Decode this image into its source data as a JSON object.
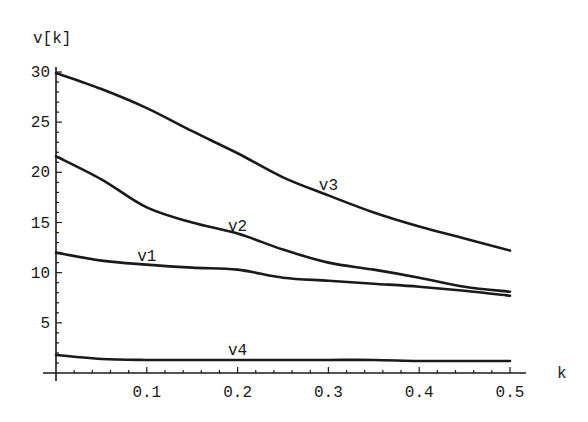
{
  "chart_data": {
    "type": "line",
    "title": "",
    "xlabel": "k",
    "ylabel": "v[k]",
    "xlim": [
      0,
      0.5
    ],
    "ylim": [
      0,
      30
    ],
    "grid": false,
    "legend": "inline curve labels",
    "x_ticks": [
      "0.1",
      "0.2",
      "0.3",
      "0.4",
      "0.5"
    ],
    "y_ticks": [
      "5",
      "10",
      "15",
      "20",
      "25",
      "30"
    ],
    "x": [
      0,
      0.05,
      0.1,
      0.15,
      0.2,
      0.25,
      0.3,
      0.35,
      0.4,
      0.45,
      0.5
    ],
    "series": [
      {
        "name": "v1",
        "values": [
          12.0,
          11.2,
          10.8,
          10.5,
          10.3,
          9.5,
          9.2,
          8.9,
          8.6,
          8.2,
          7.7
        ]
      },
      {
        "name": "v2",
        "values": [
          21.6,
          19.3,
          16.5,
          15.0,
          13.9,
          12.3,
          11.0,
          10.3,
          9.5,
          8.6,
          8.1
        ]
      },
      {
        "name": "v3",
        "values": [
          29.9,
          28.3,
          26.4,
          24.1,
          21.9,
          19.5,
          17.7,
          16.0,
          14.6,
          13.4,
          12.2
        ]
      },
      {
        "name": "v4",
        "values": [
          1.8,
          1.4,
          1.3,
          1.3,
          1.3,
          1.3,
          1.3,
          1.3,
          1.2,
          1.2,
          1.2
        ]
      }
    ],
    "annotations": [
      {
        "text": "v1",
        "x": 0.1,
        "y": 11.2
      },
      {
        "text": "v2",
        "x": 0.2,
        "y": 14.2
      },
      {
        "text": "v3",
        "x": 0.3,
        "y": 18.2
      },
      {
        "text": "v4",
        "x": 0.2,
        "y": 1.8
      }
    ]
  }
}
